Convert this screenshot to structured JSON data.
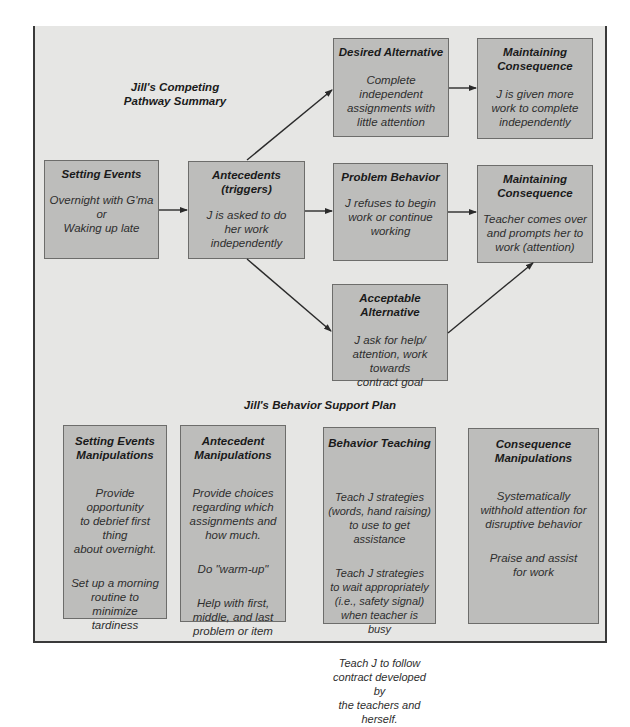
{
  "pathway": {
    "title": "Jill's Competing\nPathway Summary",
    "setting_events": {
      "heading": "Setting Events",
      "body": "Overnight with G'ma\nor\nWaking up late"
    },
    "antecedents": {
      "heading": "Antecedents\n(triggers)",
      "body": "J is asked to do\nher work\nindependently"
    },
    "desired_alternative": {
      "heading": "Desired Alternative",
      "body": "Complete independent\nassignments with\nlittle attention"
    },
    "desired_consequence": {
      "heading": "Maintaining\nConsequence",
      "body": "J is given more\nwork to complete\nindependently"
    },
    "problem_behavior": {
      "heading": "Problem Behavior",
      "body": "J refuses to begin\nwork or continue\nworking"
    },
    "problem_consequence": {
      "heading": "Maintaining\nConsequence",
      "body": "Teacher comes over\nand prompts her to\nwork (attention)"
    },
    "acceptable_alternative": {
      "heading": "Acceptable Alternative",
      "body": "J ask for help/\nattention, work towards\ncontract goal"
    }
  },
  "support_plan": {
    "title": "Jill's Behavior Support Plan",
    "columns": [
      {
        "heading": "Setting Events\nManipulations",
        "items": [
          "Provide opportunity\nto debrief first thing\nabout overnight.",
          "Set up a morning\nroutine to minimize\ntardiness"
        ]
      },
      {
        "heading": "Antecedent\nManipulations",
        "items": [
          "Provide choices\nregarding which\nassignments and\nhow much.",
          "Do \"warm-up\"",
          "Help with first,\nmiddle, and last\nproblem or item"
        ]
      },
      {
        "heading": "Behavior Teaching",
        "items": [
          "Teach J strategies\n(words, hand raising)\nto use to get assistance",
          "Teach J strategies\nto wait appropriately\n(i.e., safety signal)\nwhen teacher is busy",
          "Teach J to follow\ncontract developed by\nthe teachers and herself."
        ]
      },
      {
        "heading": "Consequence\nManipulations",
        "items": [
          "Systematically\nwithhold attention for\ndisruptive behavior",
          "Praise and assist\nfor work"
        ]
      }
    ]
  },
  "colors": {
    "frame_bg": "#e6e6e4",
    "box_bg": "#bdbdbb",
    "box_border": "#6d6d6b",
    "arrow": "#2a2a2a"
  }
}
